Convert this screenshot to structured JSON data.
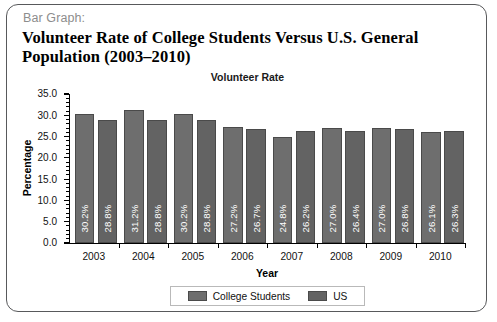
{
  "card": {
    "kicker": "Bar Graph:",
    "title": "Volunteer Rate of College Students Versus U.S. General Population (2003–2010)"
  },
  "chart_data": {
    "type": "bar",
    "title": "Volunteer Rate",
    "xlabel": "Year",
    "ylabel": "Percentage",
    "ylim": [
      0,
      35
    ],
    "ytick_labels": [
      "0.0",
      "5.0",
      "10.0",
      "15.0",
      "20.0",
      "25.0",
      "30.0",
      "35.0"
    ],
    "ytick_values": [
      0,
      5,
      10,
      15,
      20,
      25,
      30,
      35
    ],
    "minor_ticks": true,
    "grid": false,
    "legend_position": "bottom",
    "categories": [
      "2003",
      "2004",
      "2005",
      "2006",
      "2007",
      "2008",
      "2009",
      "2010"
    ],
    "series": [
      {
        "name": "College Students",
        "color": "#6e6e6e",
        "values": [
          30.2,
          31.2,
          30.2,
          27.2,
          24.8,
          27.0,
          27.0,
          26.1
        ],
        "labels": [
          "30.2%",
          "31.2%",
          "30.2%",
          "27.2%",
          "24.8%",
          "27.0%",
          "27.0%",
          "26.1%"
        ]
      },
      {
        "name": "US",
        "color": "#636363",
        "values": [
          28.8,
          28.8,
          28.8,
          26.7,
          26.2,
          26.4,
          26.8,
          26.3
        ],
        "labels": [
          "28.8%",
          "28.8%",
          "28.8%",
          "26.7%",
          "26.2%",
          "26.4%",
          "26.8%",
          "26.3%"
        ]
      }
    ]
  }
}
